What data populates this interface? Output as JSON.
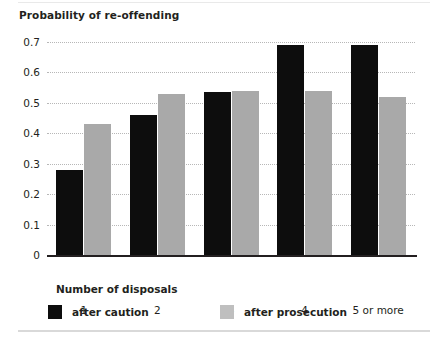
{
  "chart_data": {
    "type": "bar",
    "title": "Probability of re-offending",
    "xlabel": "Number of disposals",
    "ylabel": "",
    "categories": [
      "1",
      "2",
      "3",
      "4",
      "5 or more"
    ],
    "series": [
      {
        "name": "after caution",
        "color": "#0d0d0d",
        "values": [
          0.28,
          0.46,
          0.535,
          0.69,
          0.69
        ]
      },
      {
        "name": "after prosecution",
        "color": "#a9a9a9",
        "values": [
          0.43,
          0.53,
          0.54,
          0.54,
          0.52
        ]
      }
    ],
    "ylim": [
      0,
      0.7
    ],
    "yticks": [
      "0",
      "0.1",
      "0.2",
      "0.3",
      "0.4",
      "0.5",
      "0.6",
      "0.7"
    ],
    "ytick_values": [
      0,
      0.1,
      0.2,
      0.3,
      0.4,
      0.5,
      0.6,
      0.7
    ],
    "grid": true,
    "grid_style": "dotted",
    "grid_color": "#b7b7b7",
    "legend_position": "bottom-left",
    "axis_color": "#231f20",
    "background": "#ffffff"
  },
  "legend": {
    "items": [
      {
        "label": "after caution",
        "swatch": "caution"
      },
      {
        "label": "after prosecution",
        "swatch": "prosecution"
      }
    ]
  }
}
